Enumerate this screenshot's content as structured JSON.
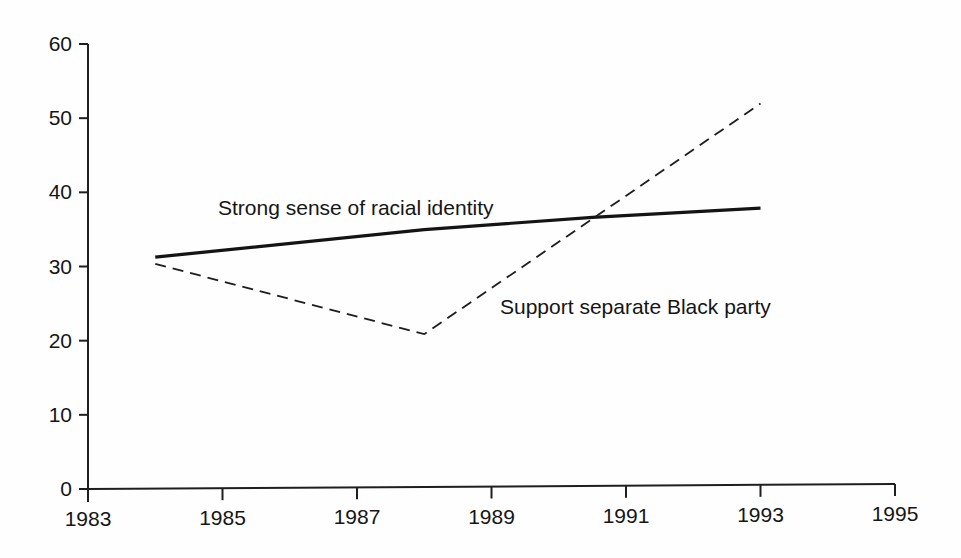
{
  "chart_data": {
    "type": "line",
    "title": "",
    "subtitle": "",
    "xlabel": "",
    "ylabel": "",
    "xlim": [
      1983,
      1995
    ],
    "ylim": [
      0,
      60
    ],
    "grid": false,
    "legend_position": "inline-annotations",
    "x_ticks": [
      "1983",
      "1985",
      "1987",
      "1989",
      "1991",
      "1993",
      "1995"
    ],
    "x_tick_values": [
      1983,
      1985,
      1987,
      1989,
      1991,
      1993,
      1995
    ],
    "y_ticks": [
      "0",
      "10",
      "20",
      "30",
      "40",
      "50",
      "60"
    ],
    "y_tick_values": [
      0,
      10,
      20,
      30,
      40,
      50,
      60
    ],
    "series": [
      {
        "name": "Strong sense of racial identity",
        "style": "solid",
        "color": "#141414",
        "width": 3.2,
        "x": [
          1984,
          1988,
          1990.5,
          1993
        ],
        "values": [
          31.2,
          34.7,
          36.2,
          37.3
        ]
      },
      {
        "name": "Support separate Black party",
        "style": "dashed",
        "color": "#1d1d1d",
        "width": 1.8,
        "x": [
          1984,
          1988,
          1993
        ],
        "values": [
          30.3,
          20.6,
          51.4
        ]
      }
    ],
    "annotations": [
      {
        "text": "Strong sense of racial identity",
        "series": "Strong sense of racial identity",
        "x_px": 218,
        "y_px": 196
      },
      {
        "text": "Support separate Black party",
        "series": "Support separate Black party",
        "x_px": 500,
        "y_px": 295
      }
    ]
  },
  "axes": {
    "origin_px": {
      "x": 88,
      "y": 489
    },
    "x_axis_end_px": 895,
    "y_axis_top_px": 44,
    "axis_color": "#1f1f1f",
    "axis_width": 2.0,
    "tick_length": 9
  }
}
